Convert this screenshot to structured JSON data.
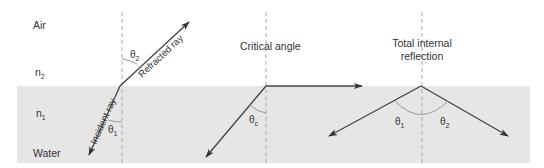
{
  "media": {
    "upper_label": "Air",
    "upper_index": {
      "base": "n",
      "sub": "2"
    },
    "lower_label": "Water",
    "lower_index": {
      "base": "n",
      "sub": "1"
    }
  },
  "panels": [
    {
      "id": "refraction",
      "rays": {
        "incident_label": "Incident ray",
        "refracted_label": "Refracted ray"
      },
      "angles": [
        {
          "base": "θ",
          "sub": "1"
        },
        {
          "base": "θ",
          "sub": "2"
        }
      ]
    },
    {
      "id": "critical",
      "title": "Critical angle",
      "angles": [
        {
          "base": "θ",
          "sub": "c"
        }
      ]
    },
    {
      "id": "tir",
      "title_line1": "Total internal",
      "title_line2": "reflection",
      "angles": [
        {
          "base": "θ",
          "sub": "1"
        },
        {
          "base": "θ",
          "sub": "2"
        }
      ]
    }
  ],
  "colors": {
    "water": "#e6e6e6",
    "ray": "#444444",
    "normal": "#aaaaaa",
    "arc": "#999999",
    "text": "#333333"
  }
}
